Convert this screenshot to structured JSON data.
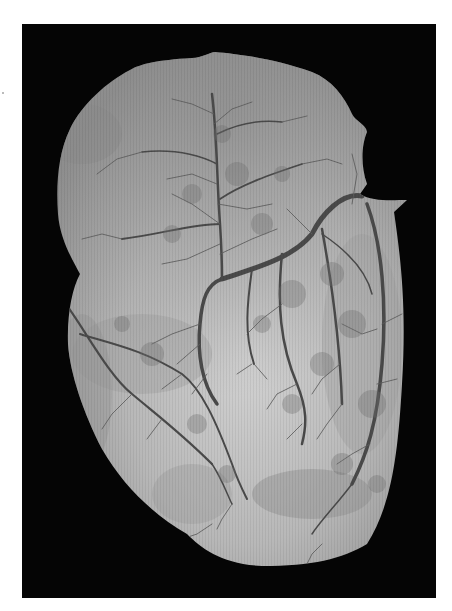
{
  "image": {
    "subject": "Grayscale photograph of a heart showing branching coronary vessels",
    "alt": "Heart with coronary vessel tree on black background",
    "colors": {
      "page_background": "#ffffff",
      "frame_background": "#050505",
      "heart_light": "#c9c9c9",
      "heart_mid": "#a9a9a9",
      "heart_dark": "#8a8a8a",
      "vessel": "#4a4a4a",
      "vessel_fine": "#6a6a6a"
    }
  }
}
